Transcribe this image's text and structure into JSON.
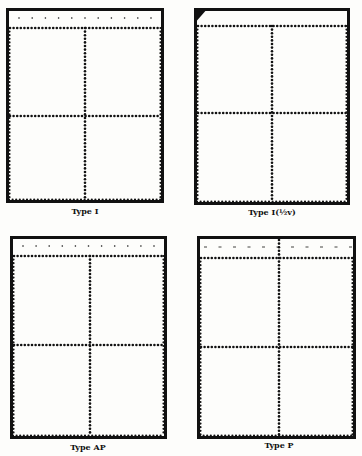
{
  "figure": {
    "panels": [
      {
        "id": "type-i",
        "label": "Type I",
        "frame": {
          "x": 6,
          "y": 8,
          "w": 158,
          "h": 195
        },
        "top_perf_y": 28,
        "vertical_perf_x": 85,
        "horizontal_perf_y": 116,
        "selvage_marks": "ticks",
        "corner_triangle": false,
        "vertical_through_selvage": false,
        "label_pos": {
          "x": 85,
          "y": 206
        }
      },
      {
        "id": "type-i-half-v",
        "label": "Type I(½v)",
        "frame": {
          "x": 194,
          "y": 8,
          "w": 156,
          "h": 197
        },
        "top_perf_y": 26,
        "vertical_perf_x": 272,
        "horizontal_perf_y": 113,
        "selvage_marks": "none",
        "corner_triangle": true,
        "vertical_through_selvage": false,
        "label_pos": {
          "x": 272,
          "y": 207
        }
      },
      {
        "id": "type-ap",
        "label": "Type AP",
        "frame": {
          "x": 10,
          "y": 236,
          "w": 157,
          "h": 203
        },
        "top_perf_y": 256,
        "vertical_perf_x": 90,
        "horizontal_perf_y": 345,
        "selvage_marks": "ticks",
        "corner_triangle": false,
        "vertical_through_selvage": false,
        "label_pos": {
          "x": 88,
          "y": 442
        }
      },
      {
        "id": "type-p",
        "label": "Type P",
        "frame": {
          "x": 197,
          "y": 236,
          "w": 159,
          "h": 203
        },
        "top_perf_y": 258,
        "vertical_perf_x": 279,
        "horizontal_perf_y": 347,
        "selvage_marks": "dashes",
        "corner_triangle": false,
        "vertical_through_selvage": true,
        "label_pos": {
          "x": 279,
          "y": 440
        }
      }
    ],
    "colors": {
      "ink": "#111111",
      "paper": "#fdfdfb"
    }
  }
}
